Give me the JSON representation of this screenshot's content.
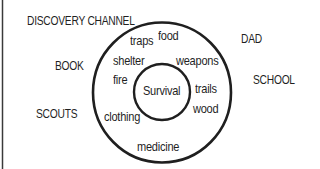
{
  "diagram": {
    "type": "circle-map",
    "center_topic": "Survival",
    "inner_items": [
      "traps",
      "food",
      "shelter",
      "weapons",
      "fire",
      "trails",
      "wood",
      "clothing",
      "medicine"
    ],
    "frame_of_reference": [
      "DISCOVERY CHANNEL",
      "DAD",
      "BOOK",
      "SCHOOL",
      "SCOUTS"
    ],
    "colors": {
      "stroke": "#1f1f1f",
      "text": "#1f1f1f",
      "background": "#ffffff"
    }
  }
}
